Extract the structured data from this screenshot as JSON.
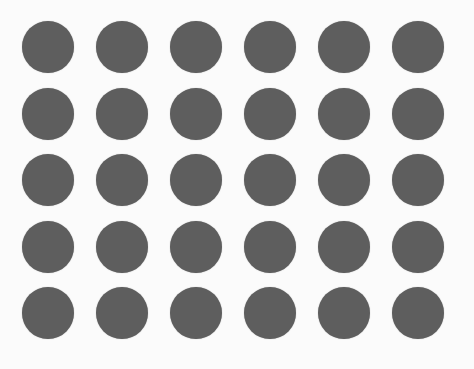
{
  "figure": {
    "rows": 5,
    "cols": 6,
    "dot_color": "#5e5e5e",
    "background_color": "#fbfbfb",
    "dot_diameter": 52,
    "first_center": [
      48,
      47
    ],
    "spacing_x": 74,
    "spacing_y": 66.5
  }
}
